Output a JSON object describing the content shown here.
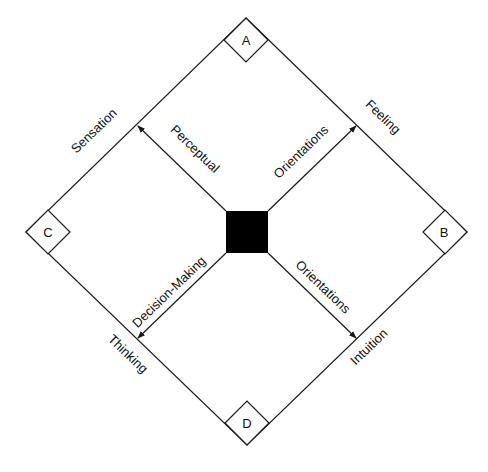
{
  "diagram": {
    "corners": {
      "top": "A",
      "right": "B",
      "left": "C",
      "bottom": "D"
    },
    "edges": {
      "top_left": "Sensation",
      "top_right": "Feeling",
      "bottom_left": "Thinking",
      "bottom_right": "Intuition"
    },
    "arrows": {
      "upper_left": "Perceptual",
      "upper_right": "Orientations",
      "lower_left": "Decision-Making",
      "lower_right": "Orientations"
    },
    "colors": {
      "line": "#1a1a1a",
      "center": "#000000",
      "background": "#ffffff"
    }
  }
}
